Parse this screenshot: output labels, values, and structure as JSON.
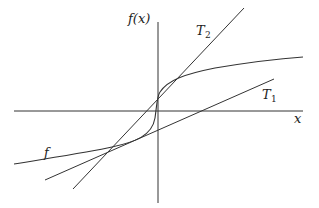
{
  "diagram": {
    "labels": {
      "y_axis": "f(x)",
      "x_axis": "x",
      "curve": "f",
      "tangent1_main": "T",
      "tangent1_sub": "1",
      "tangent2_main": "T",
      "tangent2_sub": "2"
    },
    "colors": {
      "stroke": "#333333",
      "background": "#ffffff"
    }
  }
}
